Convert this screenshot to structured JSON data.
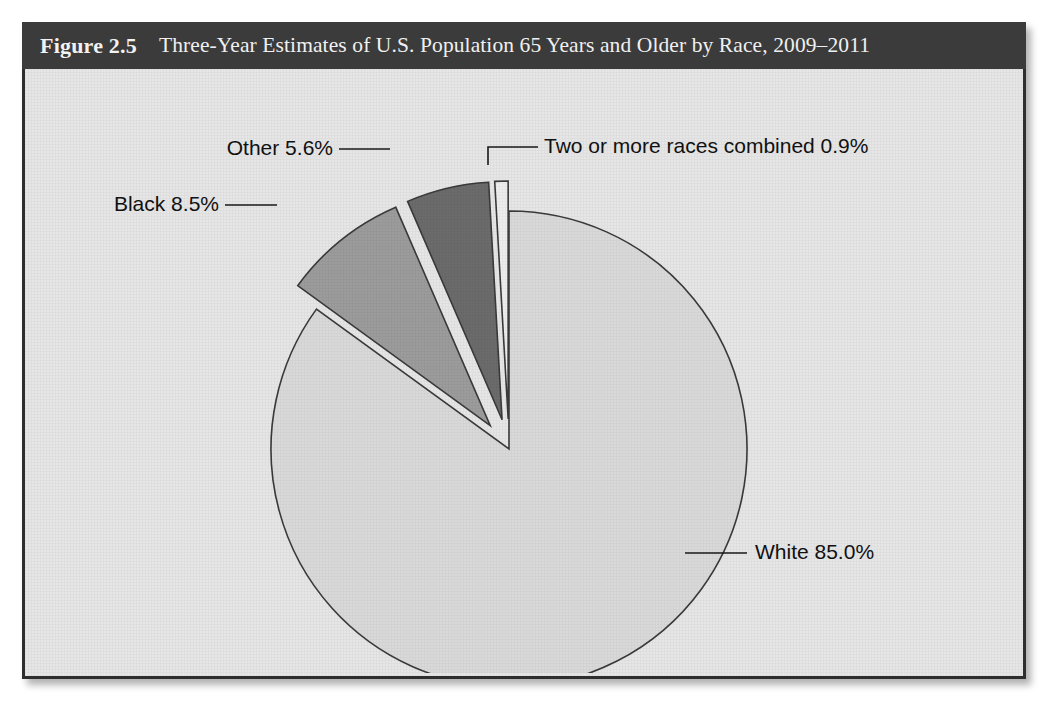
{
  "figure": {
    "number": "Figure 2.5",
    "title": "Three-Year Estimates of U.S. Population 65 Years and Older by Race, 2009–2011"
  },
  "colors": {
    "header_background": "#3b3b3b",
    "header_text": "#f0f0f0",
    "panel_background": "#e6e6e6",
    "panel_border": "#2e2e2e",
    "slice_white": "#d9d9d9",
    "slice_black": "#9c9c9c",
    "slice_other": "#6b6b6b",
    "slice_two_or_more": "#ededed",
    "slice_outline": "#3a3a3a",
    "label_text": "#111111",
    "leader_line": "#1a1a1a"
  },
  "labels": {
    "white": "White 85.0%",
    "black": "Black 8.5%",
    "other": "Other 5.6%",
    "two_or_more": "Two or more races combined 0.9%"
  },
  "chart_data": {
    "type": "pie",
    "title": "Three-Year Estimates of U.S. Population 65 Years and Older by Race, 2009–2011",
    "unit": "percent",
    "total": 100.0,
    "start_angle_deg": 0,
    "direction": "clockwise",
    "exploded": [
      "Black",
      "Other",
      "Two or more races combined"
    ],
    "legend_position": "none",
    "grid": false,
    "categories": [
      "White",
      "Black",
      "Other",
      "Two or more races combined"
    ],
    "values": [
      85.0,
      8.5,
      5.6,
      0.9
    ],
    "slices": [
      {
        "name": "White",
        "value": 85.0,
        "label": "White 85.0%",
        "color": "#d9d9d9",
        "exploded": false
      },
      {
        "name": "Black",
        "value": 8.5,
        "label": "Black 8.5%",
        "color": "#9c9c9c",
        "exploded": true
      },
      {
        "name": "Other",
        "value": 5.6,
        "label": "Other 5.6%",
        "color": "#6b6b6b",
        "exploded": true
      },
      {
        "name": "Two or more races combined",
        "value": 0.9,
        "label": "Two or more races combined 0.9%",
        "color": "#ededed",
        "exploded": true
      }
    ]
  }
}
